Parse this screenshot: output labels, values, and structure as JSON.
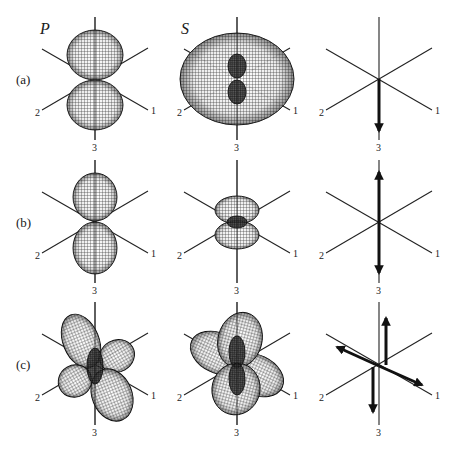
{
  "figure": {
    "column_headers": [
      "P",
      "S",
      ""
    ],
    "row_labels": [
      "(a)",
      "(b)",
      "(c)"
    ],
    "axis_labels": {
      "axis1": "1",
      "axis2": "2",
      "axis3": "3"
    },
    "colors": {
      "ink": "#111111",
      "mesh": "#2a2a2a",
      "background": "#ffffff"
    },
    "panels": [
      {
        "row": "a",
        "column": "P",
        "type": "radiation-pattern",
        "shapes": [
          {
            "cx": 0,
            "cy": -24,
            "rx": 28,
            "ry": 25,
            "rot": 0
          },
          {
            "cx": 0,
            "cy": 26,
            "rx": 28,
            "ry": 25,
            "rot": 0
          }
        ]
      },
      {
        "row": "a",
        "column": "S",
        "type": "radiation-pattern",
        "shapes": [
          {
            "cx": 0,
            "cy": 0,
            "rx": 57,
            "ry": 46,
            "rot": 0
          },
          {
            "cx": 0,
            "cy": -13,
            "rx": 9,
            "ry": 12,
            "rot": 0,
            "dark": true
          },
          {
            "cx": 0,
            "cy": 13,
            "rx": 9,
            "ry": 12,
            "rot": 0,
            "dark": true
          }
        ]
      },
      {
        "row": "a",
        "column": "source",
        "type": "force-diagram",
        "arrows": [
          {
            "x1": 0,
            "y1": 0,
            "x2": 0,
            "y2": 52
          }
        ]
      },
      {
        "row": "b",
        "column": "P",
        "type": "radiation-pattern",
        "shapes": [
          {
            "cx": 0,
            "cy": -25,
            "rx": 22,
            "ry": 24,
            "rot": 0
          },
          {
            "cx": 0,
            "cy": 26,
            "rx": 22,
            "ry": 26,
            "rot": 0
          }
        ]
      },
      {
        "row": "b",
        "column": "S",
        "type": "radiation-pattern",
        "shapes": [
          {
            "cx": 0,
            "cy": -12,
            "rx": 22,
            "ry": 14,
            "rot": 0
          },
          {
            "cx": 0,
            "cy": 13,
            "rx": 22,
            "ry": 14,
            "rot": 0
          },
          {
            "cx": 0,
            "cy": 0,
            "rx": 10,
            "ry": 6,
            "rot": 0,
            "dark": true
          }
        ]
      },
      {
        "row": "b",
        "column": "source",
        "type": "force-diagram",
        "arrows": [
          {
            "x1": 0,
            "y1": 0,
            "x2": 0,
            "y2": -50
          },
          {
            "x1": 0,
            "y1": 0,
            "x2": 0,
            "y2": 51
          }
        ]
      },
      {
        "row": "c",
        "column": "P",
        "type": "radiation-pattern",
        "shapes": [
          {
            "cx": -14,
            "cy": -23,
            "rx": 18,
            "ry": 28,
            "rot": -22
          },
          {
            "cx": 22,
            "cy": -8,
            "rx": 18,
            "ry": 16,
            "rot": -30
          },
          {
            "cx": -20,
            "cy": 17,
            "rx": 17,
            "ry": 16,
            "rot": -30
          },
          {
            "cx": 17,
            "cy": 31,
            "rx": 20,
            "ry": 27,
            "rot": -22
          },
          {
            "cx": 0,
            "cy": 2,
            "rx": 8,
            "ry": 18,
            "rot": 0,
            "dark": true
          }
        ]
      },
      {
        "row": "c",
        "column": "S",
        "type": "radiation-pattern",
        "shapes": [
          {
            "cx": -19,
            "cy": -11,
            "rx": 29,
            "ry": 20,
            "rot": 25
          },
          {
            "cx": 19,
            "cy": 11,
            "rx": 29,
            "ry": 20,
            "rot": 25
          },
          {
            "cx": 3,
            "cy": -24,
            "rx": 22,
            "ry": 28,
            "rot": 15
          },
          {
            "cx": -1,
            "cy": 25,
            "rx": 24,
            "ry": 26,
            "rot": 15
          },
          {
            "cx": 0,
            "cy": -12,
            "rx": 8,
            "ry": 16,
            "rot": 0,
            "dark": true
          },
          {
            "cx": 0,
            "cy": 15,
            "rx": 8,
            "ry": 16,
            "rot": 0,
            "dark": true
          }
        ]
      },
      {
        "row": "c",
        "column": "source",
        "type": "force-diagram",
        "arrows": [
          {
            "x1": 7,
            "y1": 1,
            "x2": 7,
            "y2": -46
          },
          {
            "x1": -6,
            "y1": 3,
            "x2": -6,
            "y2": 48
          },
          {
            "x1": 0,
            "y1": 2,
            "x2": -42,
            "y2": -17
          },
          {
            "x1": 0,
            "y1": 2,
            "x2": 43,
            "y2": 21
          }
        ]
      }
    ]
  }
}
